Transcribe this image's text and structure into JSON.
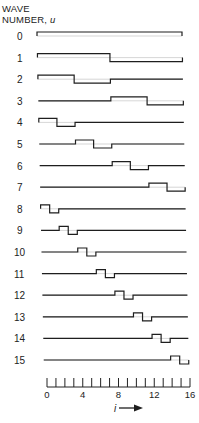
{
  "title": {
    "line1": "WAVE",
    "line2": "NUMBER, ",
    "var": "u"
  },
  "axis": {
    "label": "i",
    "arrow": "arrow-right-icon",
    "min": 0,
    "max": 16,
    "tick_step": 1,
    "labeled_ticks": [
      0,
      4,
      8,
      12,
      16
    ]
  },
  "chart_data": {
    "type": "diagram",
    "title": "WAVE NUMBER, u",
    "xlabel": "i",
    "rows": [
      {
        "u": 0,
        "label": "0",
        "segments": [
          [
            0,
            16,
            1
          ]
        ]
      },
      {
        "u": 1,
        "label": "1",
        "segments": [
          [
            0,
            8,
            1
          ],
          [
            8,
            16,
            -1
          ]
        ]
      },
      {
        "u": 2,
        "label": "2",
        "segments": [
          [
            0,
            4,
            1
          ],
          [
            4,
            8,
            -1
          ],
          [
            8,
            16,
            0
          ]
        ]
      },
      {
        "u": 3,
        "label": "3",
        "segments": [
          [
            0,
            8,
            0
          ],
          [
            8,
            12,
            1
          ],
          [
            12,
            16,
            -1
          ]
        ]
      },
      {
        "u": 4,
        "label": "4",
        "segments": [
          [
            0,
            2,
            1
          ],
          [
            2,
            4,
            -1
          ],
          [
            4,
            16,
            0
          ]
        ]
      },
      {
        "u": 5,
        "label": "5",
        "segments": [
          [
            0,
            4,
            0
          ],
          [
            4,
            6,
            1
          ],
          [
            6,
            8,
            -1
          ],
          [
            8,
            16,
            0
          ]
        ]
      },
      {
        "u": 6,
        "label": "6",
        "segments": [
          [
            0,
            8,
            0
          ],
          [
            8,
            10,
            1
          ],
          [
            10,
            12,
            -1
          ],
          [
            12,
            16,
            0
          ]
        ]
      },
      {
        "u": 7,
        "label": "7",
        "segments": [
          [
            0,
            12,
            0
          ],
          [
            12,
            14,
            1
          ],
          [
            14,
            16,
            -1
          ]
        ]
      },
      {
        "u": 8,
        "label": "8",
        "segments": [
          [
            0,
            1,
            1
          ],
          [
            1,
            2,
            -1
          ],
          [
            2,
            16,
            0
          ]
        ]
      },
      {
        "u": 9,
        "label": "9",
        "segments": [
          [
            0,
            2,
            0
          ],
          [
            2,
            3,
            1
          ],
          [
            3,
            4,
            -1
          ],
          [
            4,
            16,
            0
          ]
        ]
      },
      {
        "u": 10,
        "label": "10",
        "segments": [
          [
            0,
            4,
            0
          ],
          [
            4,
            5,
            1
          ],
          [
            5,
            6,
            -1
          ],
          [
            6,
            16,
            0
          ]
        ]
      },
      {
        "u": 11,
        "label": "11",
        "segments": [
          [
            0,
            6,
            0
          ],
          [
            6,
            7,
            1
          ],
          [
            7,
            8,
            -1
          ],
          [
            8,
            16,
            0
          ]
        ]
      },
      {
        "u": 12,
        "label": "12",
        "segments": [
          [
            0,
            8,
            0
          ],
          [
            8,
            9,
            1
          ],
          [
            9,
            10,
            -1
          ],
          [
            10,
            16,
            0
          ]
        ]
      },
      {
        "u": 13,
        "label": "13",
        "segments": [
          [
            0,
            10,
            0
          ],
          [
            10,
            11,
            1
          ],
          [
            11,
            12,
            -1
          ],
          [
            12,
            16,
            0
          ]
        ]
      },
      {
        "u": 14,
        "label": "14",
        "segments": [
          [
            0,
            12,
            0
          ],
          [
            12,
            13,
            1
          ],
          [
            13,
            14,
            -1
          ],
          [
            14,
            16,
            0
          ]
        ]
      },
      {
        "u": 15,
        "label": "15",
        "segments": [
          [
            0,
            14,
            0
          ],
          [
            14,
            15,
            1
          ],
          [
            15,
            16,
            -1
          ]
        ]
      }
    ]
  }
}
